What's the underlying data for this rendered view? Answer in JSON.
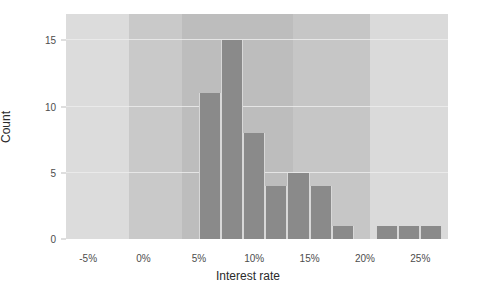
{
  "chart_data": {
    "type": "bar",
    "title": "",
    "xlabel": "Interest rate",
    "ylabel": "Count",
    "categories": [
      "5%-7%",
      "7%-9%",
      "9%-11%",
      "11%-13%",
      "13%-15%",
      "15%-17%",
      "17%-19%",
      "19%-21%",
      "21%-23%",
      "23%-25%",
      "25%-27%"
    ],
    "bin_starts": [
      5,
      7,
      9,
      11,
      13,
      15,
      17,
      19,
      21,
      23,
      25
    ],
    "bin_width": 2,
    "values": [
      11,
      15,
      8,
      4,
      5,
      4,
      1,
      0,
      1,
      1,
      1
    ],
    "xlim": [
      -7,
      27.5
    ],
    "ylim": [
      0,
      17
    ],
    "xticks": [
      -5,
      0,
      5,
      10,
      15,
      20,
      25
    ],
    "xticklabels": [
      "-5%",
      "0%",
      "5%",
      "10%",
      "15%",
      "20%",
      "25%"
    ],
    "yticks": [
      0,
      5,
      10,
      15
    ],
    "yticklabels": [
      "0",
      "5",
      "10",
      "15"
    ],
    "grid": "horizontal",
    "legend": "none",
    "bar_color": "#8a8a8a",
    "plot_background": "#d8d8d8",
    "gridline_color": "#ececec",
    "background_bands": [
      {
        "from": -7,
        "to": -1.3,
        "color": "#dcdcdc"
      },
      {
        "from": -1.3,
        "to": 3.5,
        "color": "#c9c9c9"
      },
      {
        "from": 3.5,
        "to": 13.5,
        "color": "#bdbdbd"
      },
      {
        "from": 13.5,
        "to": 20.5,
        "color": "#c6c6c6"
      },
      {
        "from": 20.5,
        "to": 27.5,
        "color": "#dadada"
      }
    ]
  }
}
